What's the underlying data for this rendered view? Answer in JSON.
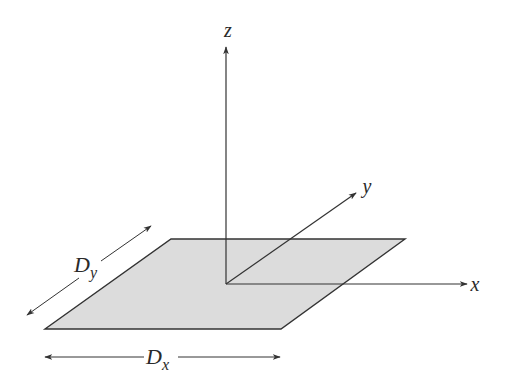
{
  "diagram": {
    "title": "",
    "colors": {
      "background": "#ffffff",
      "line": "#333333",
      "plane_fill": "#dcdcdc"
    },
    "axes": {
      "z": {
        "label": "z"
      },
      "y": {
        "label": "y"
      },
      "x": {
        "label": "x"
      }
    },
    "dimensions": {
      "dx": {
        "label": "D",
        "subscript": "x"
      },
      "dy": {
        "label": "D",
        "subscript": "y"
      }
    },
    "plane": {
      "shape": "parallelogram",
      "description": "shaded rectangular plate in the x-y plane"
    }
  }
}
